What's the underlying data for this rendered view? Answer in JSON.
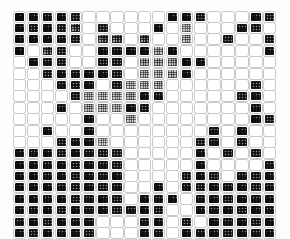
{
  "figure": {
    "title": "",
    "background_color": "#fdfdfd",
    "cell_border_color": "#ffffff",
    "cell_outline_color": "#c9c9c9",
    "dark_color": "#1a1a1a",
    "light_color": "#ffffff"
  },
  "chart_data": {
    "type": "heatmap",
    "title": "",
    "xlabel": "",
    "ylabel": "",
    "rows": 20,
    "cols": 19,
    "grid": false,
    "legend": "none",
    "value_range": [
      0,
      1
    ],
    "values": [
      [
        0.95,
        0.8,
        0.78,
        0.82,
        0.72,
        0.0,
        0.0,
        0.0,
        0.0,
        0.0,
        0.0,
        0.88,
        0.85,
        0.76,
        0.0,
        0.0,
        0.0,
        0.82,
        0.74
      ],
      [
        0.88,
        0.76,
        0.8,
        0.74,
        0.7,
        0.0,
        0.72,
        0.0,
        0.0,
        0.0,
        0.8,
        0.0,
        0.3,
        0.0,
        0.0,
        0.0,
        0.78,
        0.72,
        0.0
      ],
      [
        0.82,
        0.86,
        0.84,
        0.78,
        0.74,
        0.0,
        0.68,
        0.66,
        0.0,
        0.7,
        0.0,
        0.0,
        0.35,
        0.0,
        0.0,
        0.74,
        0.0,
        0.0,
        0.76
      ],
      [
        0.9,
        0.0,
        0.7,
        0.72,
        0.0,
        0.0,
        0.8,
        0.78,
        0.82,
        0.84,
        0.4,
        0.86,
        0.0,
        0.0,
        0.0,
        0.0,
        0.0,
        0.0,
        0.8
      ],
      [
        0.0,
        0.84,
        0.78,
        0.76,
        0.0,
        0.0,
        0.76,
        0.74,
        0.0,
        0.45,
        0.42,
        0.38,
        0.84,
        0.82,
        0.0,
        0.0,
        0.0,
        0.0,
        0.0
      ],
      [
        0.0,
        0.0,
        0.76,
        0.8,
        0.78,
        0.82,
        0.8,
        0.76,
        0.0,
        0.35,
        0.32,
        0.4,
        0.8,
        0.0,
        0.0,
        0.0,
        0.0,
        0.0,
        0.0
      ],
      [
        0.0,
        0.0,
        0.0,
        0.78,
        0.74,
        0.8,
        0.0,
        0.72,
        0.3,
        0.34,
        0.36,
        0.0,
        0.0,
        0.0,
        0.0,
        0.0,
        0.0,
        0.76,
        0.0
      ],
      [
        0.0,
        0.0,
        0.0,
        0.0,
        0.76,
        0.32,
        0.3,
        0.34,
        0.36,
        0.8,
        0.78,
        0.0,
        0.0,
        0.0,
        0.0,
        0.0,
        0.74,
        0.8,
        0.0
      ],
      [
        0.0,
        0.0,
        0.0,
        0.78,
        0.0,
        0.36,
        0.34,
        0.3,
        0.82,
        0.76,
        0.0,
        0.0,
        0.0,
        0.0,
        0.0,
        0.0,
        0.0,
        0.78,
        0.0
      ],
      [
        0.0,
        0.0,
        0.0,
        0.0,
        0.0,
        0.8,
        0.0,
        0.0,
        0.35,
        0.0,
        0.0,
        0.0,
        0.0,
        0.0,
        0.0,
        0.0,
        0.0,
        0.8,
        0.74
      ],
      [
        0.0,
        0.0,
        0.8,
        0.0,
        0.0,
        0.82,
        0.0,
        0.0,
        0.0,
        0.0,
        0.0,
        0.0,
        0.0,
        0.0,
        0.78,
        0.0,
        0.82,
        0.0,
        0.0
      ],
      [
        0.0,
        0.0,
        0.0,
        0.76,
        0.78,
        0.8,
        0.28,
        0.0,
        0.0,
        0.0,
        0.0,
        0.0,
        0.0,
        0.74,
        0.78,
        0.0,
        0.76,
        0.0,
        0.0
      ],
      [
        0.84,
        0.78,
        0.8,
        0.76,
        0.82,
        0.78,
        0.74,
        0.72,
        0.0,
        0.0,
        0.0,
        0.0,
        0.0,
        0.8,
        0.0,
        0.76,
        0.0,
        0.74,
        0.0
      ],
      [
        0.86,
        0.8,
        0.78,
        0.82,
        0.76,
        0.8,
        0.78,
        0.74,
        0.0,
        0.0,
        0.0,
        0.0,
        0.0,
        0.82,
        0.0,
        0.0,
        0.0,
        0.0,
        0.78
      ],
      [
        0.82,
        0.84,
        0.78,
        0.8,
        0.76,
        0.82,
        0.78,
        0.8,
        0.0,
        0.0,
        0.0,
        0.0,
        0.76,
        0.8,
        0.74,
        0.0,
        0.78,
        0.76,
        0.8
      ],
      [
        0.84,
        0.8,
        0.82,
        0.78,
        0.76,
        0.8,
        0.74,
        0.78,
        0.0,
        0.0,
        0.8,
        0.0,
        0.78,
        0.76,
        0.82,
        0.78,
        0.8,
        0.74,
        0.78
      ],
      [
        0.8,
        0.82,
        0.78,
        0.8,
        0.76,
        0.78,
        0.82,
        0.76,
        0.0,
        0.8,
        0.78,
        0.82,
        0.0,
        0.78,
        0.8,
        0.76,
        0.82,
        0.78,
        0.8
      ],
      [
        0.82,
        0.78,
        0.8,
        0.76,
        0.82,
        0.78,
        0.8,
        0.74,
        0.78,
        0.8,
        0.76,
        0.0,
        0.0,
        0.8,
        0.78,
        0.82,
        0.76,
        0.8,
        0.78
      ],
      [
        0.78,
        0.8,
        0.76,
        0.82,
        0.78,
        0.8,
        0.0,
        0.0,
        0.0,
        0.78,
        0.8,
        0.0,
        0.76,
        0.0,
        0.8,
        0.78,
        0.82,
        0.76,
        0.8
      ],
      [
        0.8,
        0.76,
        0.82,
        0.78,
        0.8,
        0.76,
        0.0,
        0.0,
        0.0,
        0.8,
        0.78,
        0.0,
        0.82,
        0.78,
        0.8,
        0.76,
        0.82,
        0.78,
        0.8
      ]
    ]
  }
}
